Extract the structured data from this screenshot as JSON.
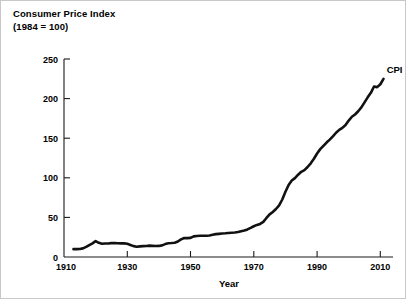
{
  "chart_data": {
    "type": "line",
    "title": "Consumer Price Index",
    "subtitle": "(1984 = 100)",
    "xlabel": "Year",
    "ylabel": "",
    "xlim": [
      1910,
      2014
    ],
    "ylim": [
      0,
      260
    ],
    "xticks": [
      1910,
      1930,
      1950,
      1970,
      1990,
      2010
    ],
    "yticks": [
      0,
      50,
      100,
      150,
      200,
      250
    ],
    "xticklabels": [
      "1910",
      "1930",
      "1950",
      "1970",
      "1990",
      "2010"
    ],
    "yticklabels": [
      "0",
      "50",
      "100",
      "150",
      "200",
      "250"
    ],
    "grid": false,
    "legend": "inline-right-end",
    "annotations": [
      {
        "text": "CPI",
        "x": 2012,
        "y": 232
      }
    ],
    "series": [
      {
        "name": "CPI",
        "color": "#111111",
        "x": [
          1913,
          1914,
          1915,
          1916,
          1917,
          1918,
          1919,
          1920,
          1921,
          1922,
          1923,
          1924,
          1925,
          1926,
          1927,
          1928,
          1929,
          1930,
          1931,
          1932,
          1933,
          1934,
          1935,
          1936,
          1937,
          1938,
          1939,
          1940,
          1941,
          1942,
          1943,
          1944,
          1945,
          1946,
          1947,
          1948,
          1949,
          1950,
          1951,
          1952,
          1953,
          1954,
          1955,
          1956,
          1957,
          1958,
          1959,
          1960,
          1961,
          1962,
          1963,
          1964,
          1965,
          1966,
          1967,
          1968,
          1969,
          1970,
          1971,
          1972,
          1973,
          1974,
          1975,
          1976,
          1977,
          1978,
          1979,
          1980,
          1981,
          1982,
          1983,
          1984,
          1985,
          1986,
          1987,
          1988,
          1989,
          1990,
          1991,
          1992,
          1993,
          1994,
          1995,
          1996,
          1997,
          1998,
          1999,
          2000,
          2001,
          2002,
          2003,
          2004,
          2005,
          2006,
          2007,
          2008,
          2009,
          2010,
          2011
        ],
        "values": [
          9.9,
          10.0,
          10.1,
          10.9,
          12.8,
          15.1,
          17.3,
          20.0,
          17.9,
          16.8,
          17.1,
          17.1,
          17.5,
          17.7,
          17.4,
          17.2,
          17.2,
          16.7,
          15.2,
          13.7,
          13.0,
          13.4,
          13.7,
          13.9,
          14.4,
          14.1,
          13.9,
          14.0,
          14.7,
          16.3,
          17.3,
          17.6,
          18.0,
          19.5,
          22.3,
          24.0,
          23.8,
          24.1,
          26.0,
          26.6,
          26.8,
          26.9,
          26.8,
          27.2,
          28.1,
          28.9,
          29.2,
          29.6,
          29.9,
          30.3,
          30.6,
          31.0,
          31.5,
          32.5,
          33.4,
          34.8,
          36.7,
          38.8,
          40.5,
          41.8,
          44.4,
          49.3,
          53.8,
          56.9,
          60.6,
          65.2,
          72.6,
          82.4,
          90.9,
          96.5,
          99.6,
          103.9,
          107.6,
          109.7,
          113.6,
          118.3,
          124.0,
          130.7,
          136.2,
          140.3,
          144.5,
          148.2,
          152.4,
          156.9,
          160.5,
          163.0,
          166.6,
          172.2,
          177.1,
          179.9,
          184.0,
          188.9,
          195.3,
          201.6,
          207.3,
          215.3,
          214.5,
          218.1,
          224.9
        ]
      }
    ]
  }
}
